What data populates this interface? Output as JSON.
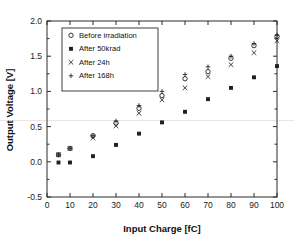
{
  "chart_data": {
    "type": "scatter",
    "title": "",
    "xlabel": "Input Charge [fC]",
    "ylabel": "Output Voltage [V]",
    "xlim": [
      0,
      100
    ],
    "ylim": [
      -0.5,
      2.0
    ],
    "xticks": [
      0,
      10,
      20,
      30,
      40,
      50,
      60,
      70,
      80,
      90,
      100
    ],
    "yticks": [
      -0.5,
      0.0,
      0.5,
      1.0,
      1.5,
      2.0
    ],
    "xticklabels": [
      "0",
      "10",
      "20",
      "30",
      "40",
      "50",
      "60",
      "70",
      "80",
      "90",
      "100"
    ],
    "yticklabels": [
      "-0.5",
      "0.0",
      "0.5",
      "1.0",
      "1.5",
      "2.0"
    ],
    "grid": false,
    "legend_position": "upper left",
    "x": [
      5,
      10,
      20,
      30,
      40,
      50,
      60,
      70,
      80,
      90,
      100
    ],
    "series": [
      {
        "name": "Before irradiation",
        "marker": "open-circle",
        "values": [
          0.1,
          0.19,
          0.37,
          0.55,
          0.76,
          0.94,
          1.18,
          1.28,
          1.47,
          1.65,
          1.78
        ]
      },
      {
        "name": "After 50krad",
        "marker": "filled-square",
        "values": [
          -0.01,
          -0.01,
          0.08,
          0.24,
          0.4,
          0.56,
          0.71,
          0.89,
          1.05,
          1.2,
          1.36
        ]
      },
      {
        "name": "After 24h",
        "marker": "cross-x",
        "values": [
          0.1,
          0.19,
          0.34,
          0.51,
          0.69,
          0.88,
          1.05,
          1.21,
          1.38,
          1.55,
          1.72
        ]
      },
      {
        "name": "After 168h",
        "marker": "plus",
        "values": [
          0.1,
          0.19,
          0.37,
          0.58,
          0.8,
          1.0,
          1.24,
          1.35,
          1.5,
          1.68,
          1.8
        ]
      }
    ]
  },
  "axes": {
    "xlabel": "Input Charge [fC]",
    "ylabel": "Output Voltage [V]"
  },
  "legend": {
    "items": [
      {
        "label": "Before irradiation"
      },
      {
        "label": "After 50krad"
      },
      {
        "label": "After 24h"
      },
      {
        "label": "After 168h"
      }
    ]
  }
}
